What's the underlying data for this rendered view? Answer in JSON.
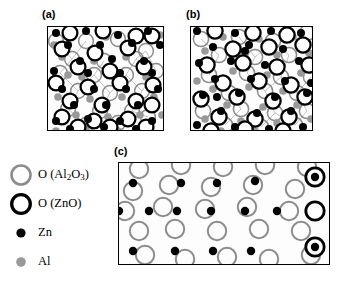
{
  "figure": {
    "panels": [
      {
        "id": "a",
        "label": "(a)",
        "x": 47,
        "y": 26,
        "w": 117,
        "h": 105
      },
      {
        "id": "b",
        "label": "(b)",
        "x": 190,
        "y": 26,
        "w": 123,
        "h": 105
      },
      {
        "id": "c",
        "label": "(c)",
        "x": 118,
        "y": 162,
        "w": 212,
        "h": 103
      }
    ],
    "labels": {
      "a": "(a)",
      "b": "(b)",
      "c": "(c)"
    }
  },
  "legend": {
    "items": [
      {
        "key": "o_al2o3",
        "glyph": "gray-ring-icon",
        "label_html": "O (Al<sub>2</sub>O<sub>3</sub>)",
        "label": "O (Al2O3)",
        "color": "#8c8c8c",
        "style": "ring"
      },
      {
        "key": "o_zno",
        "glyph": "black-ring-icon",
        "label_html": "O (ZnO)",
        "label": "O (ZnO)",
        "color": "#000000",
        "style": "ring"
      },
      {
        "key": "zn",
        "glyph": "black-dot-icon",
        "label_html": "Zn",
        "label": "Zn",
        "color": "#000000",
        "style": "dot"
      },
      {
        "key": "al",
        "glyph": "gray-dot-icon",
        "label_html": "Al",
        "label": "Al",
        "color": "#999999",
        "style": "dot"
      }
    ]
  },
  "colors": {
    "o_zno_ring": "#000000",
    "o_al2o3_ring": "#8c8c8c",
    "zn_dot": "#000000",
    "al_dot": "#999999",
    "panel_border": "#000000",
    "panel_bg": "#fdfdfd"
  },
  "chart_data": {
    "type": "scatter",
    "title": "",
    "xlabel": "",
    "ylabel": "",
    "species": [
      "O (Al2O3)",
      "O (ZnO)",
      "Zn",
      "Al"
    ],
    "panel_a": {
      "caption": "(a)",
      "o_zno_rings": [
        [
          22,
          6
        ],
        [
          55,
          4
        ],
        [
          88,
          9
        ],
        [
          14,
          22
        ],
        [
          47,
          26
        ],
        [
          80,
          21
        ],
        [
          104,
          9
        ],
        [
          30,
          40
        ],
        [
          62,
          44
        ],
        [
          96,
          40
        ],
        [
          8,
          56
        ],
        [
          40,
          60
        ],
        [
          72,
          56
        ],
        [
          105,
          58
        ],
        [
          22,
          74
        ],
        [
          54,
          78
        ],
        [
          88,
          74
        ],
        [
          14,
          90
        ],
        [
          46,
          94
        ],
        [
          80,
          92
        ],
        [
          104,
          78
        ],
        [
          30,
          100
        ],
        [
          62,
          100
        ],
        [
          98,
          100
        ]
      ],
      "o_al2o3_rings": [
        [
          38,
          14
        ],
        [
          70,
          12
        ],
        [
          98,
          24
        ],
        [
          24,
          32
        ],
        [
          56,
          34
        ],
        [
          88,
          32
        ],
        [
          12,
          46
        ],
        [
          46,
          48
        ],
        [
          78,
          48
        ],
        [
          30,
          64
        ],
        [
          62,
          66
        ],
        [
          94,
          64
        ],
        [
          20,
          82
        ],
        [
          52,
          84
        ],
        [
          84,
          84
        ],
        [
          38,
          98
        ],
        [
          70,
          96
        ],
        [
          100,
          90
        ],
        [
          8,
          14
        ],
        [
          108,
          44
        ]
      ],
      "zn_dots": [
        [
          8,
          6
        ],
        [
          38,
          4
        ],
        [
          70,
          8
        ],
        [
          100,
          4
        ],
        [
          20,
          18
        ],
        [
          52,
          18
        ],
        [
          84,
          16
        ],
        [
          112,
          18
        ],
        [
          32,
          34
        ],
        [
          64,
          32
        ],
        [
          96,
          34
        ],
        [
          6,
          44
        ],
        [
          40,
          46
        ],
        [
          72,
          46
        ],
        [
          104,
          46
        ],
        [
          14,
          62
        ],
        [
          46,
          62
        ],
        [
          78,
          62
        ],
        [
          110,
          62
        ],
        [
          26,
          78
        ],
        [
          58,
          78
        ],
        [
          90,
          78
        ],
        [
          8,
          94
        ],
        [
          40,
          92
        ],
        [
          72,
          94
        ],
        [
          104,
          94
        ],
        [
          56,
          100
        ],
        [
          22,
          102
        ],
        [
          88,
          102
        ]
      ],
      "al_dots": [
        [
          26,
          4
        ],
        [
          58,
          10
        ],
        [
          90,
          6
        ],
        [
          112,
          8
        ],
        [
          14,
          30
        ],
        [
          46,
          34
        ],
        [
          78,
          30
        ],
        [
          6,
          18
        ],
        [
          34,
          50
        ],
        [
          66,
          50
        ],
        [
          98,
          50
        ],
        [
          20,
          48
        ],
        [
          10,
          70
        ],
        [
          42,
          72
        ],
        [
          74,
          70
        ],
        [
          106,
          70
        ],
        [
          28,
          88
        ],
        [
          60,
          90
        ],
        [
          92,
          88
        ],
        [
          114,
          88
        ],
        [
          38,
          102
        ],
        [
          70,
          104
        ],
        [
          102,
          104
        ],
        [
          8,
          104
        ]
      ]
    },
    "panel_b": {
      "caption": "(b)",
      "o_zno_rings": [
        [
          24,
          4
        ],
        [
          62,
          6
        ],
        [
          96,
          8
        ],
        [
          42,
          22
        ],
        [
          78,
          20
        ],
        [
          112,
          18
        ],
        [
          16,
          38
        ],
        [
          52,
          36
        ],
        [
          86,
          40
        ],
        [
          118,
          38
        ],
        [
          32,
          56
        ],
        [
          68,
          54
        ],
        [
          100,
          58
        ],
        [
          10,
          72
        ],
        [
          46,
          70
        ],
        [
          82,
          74
        ],
        [
          114,
          70
        ],
        [
          28,
          90
        ],
        [
          64,
          92
        ],
        [
          98,
          90
        ],
        [
          54,
          102
        ],
        [
          20,
          104
        ],
        [
          92,
          104
        ]
      ],
      "o_al2o3_rings": [
        [
          10,
          12
        ],
        [
          48,
          10
        ],
        [
          82,
          14
        ],
        [
          116,
          6
        ],
        [
          28,
          28
        ],
        [
          64,
          30
        ],
        [
          98,
          28
        ],
        [
          18,
          48
        ],
        [
          56,
          46
        ],
        [
          90,
          50
        ],
        [
          120,
          50
        ],
        [
          38,
          66
        ],
        [
          74,
          64
        ],
        [
          106,
          66
        ],
        [
          12,
          84
        ],
        [
          50,
          82
        ],
        [
          84,
          86
        ],
        [
          116,
          84
        ],
        [
          34,
          98
        ],
        [
          70,
          100
        ],
        [
          104,
          98
        ]
      ],
      "zn_dots": [
        [
          6,
          4
        ],
        [
          44,
          6
        ],
        [
          80,
          4
        ],
        [
          110,
          6
        ],
        [
          22,
          20
        ],
        [
          58,
          18
        ],
        [
          92,
          22
        ],
        [
          8,
          36
        ],
        [
          40,
          34
        ],
        [
          74,
          38
        ],
        [
          108,
          34
        ],
        [
          24,
          52
        ],
        [
          60,
          52
        ],
        [
          94,
          54
        ],
        [
          120,
          56
        ],
        [
          12,
          68
        ],
        [
          48,
          66
        ],
        [
          84,
          70
        ],
        [
          116,
          66
        ],
        [
          30,
          84
        ],
        [
          66,
          86
        ],
        [
          100,
          84
        ],
        [
          6,
          98
        ],
        [
          44,
          100
        ],
        [
          78,
          102
        ],
        [
          112,
          100
        ],
        [
          54,
          24
        ],
        [
          26,
          70
        ]
      ],
      "al_dots": [
        [
          32,
          10
        ],
        [
          68,
          12
        ],
        [
          102,
          10
        ],
        [
          14,
          24
        ],
        [
          50,
          26
        ],
        [
          86,
          28
        ],
        [
          118,
          26
        ],
        [
          6,
          54
        ],
        [
          42,
          44
        ],
        [
          76,
          48
        ],
        [
          110,
          46
        ],
        [
          22,
          62
        ],
        [
          58,
          60
        ],
        [
          92,
          64
        ],
        [
          36,
          78
        ],
        [
          72,
          80
        ],
        [
          106,
          78
        ],
        [
          14,
          92
        ],
        [
          50,
          94
        ],
        [
          86,
          96
        ],
        [
          120,
          92
        ],
        [
          30,
          104
        ],
        [
          64,
          104
        ],
        [
          98,
          106
        ]
      ]
    },
    "panel_c": {
      "caption": "(c)",
      "o_al2o3_rings": [
        [
          20,
          6
        ],
        [
          62,
          2
        ],
        [
          104,
          4
        ],
        [
          146,
          2
        ],
        [
          188,
          4
        ],
        [
          14,
          28
        ],
        [
          50,
          22
        ],
        [
          92,
          24
        ],
        [
          134,
          22
        ],
        [
          176,
          26
        ],
        [
          6,
          48
        ],
        [
          44,
          44
        ],
        [
          86,
          46
        ],
        [
          128,
          44
        ],
        [
          170,
          48
        ],
        [
          20,
          68
        ],
        [
          56,
          66
        ],
        [
          98,
          68
        ],
        [
          140,
          66
        ],
        [
          182,
          68
        ],
        [
          26,
          92
        ],
        [
          66,
          96
        ],
        [
          108,
          94
        ],
        [
          150,
          96
        ],
        [
          192,
          92
        ]
      ],
      "o_zno_rings": [
        [
          196,
          14
        ],
        [
          196,
          48
        ],
        [
          196,
          84
        ]
      ],
      "zn_dots": [
        [
          14,
          20
        ],
        [
          62,
          20
        ],
        [
          98,
          20
        ],
        [
          136,
          18
        ],
        [
          0,
          48
        ],
        [
          30,
          48
        ],
        [
          58,
          48
        ],
        [
          92,
          48
        ],
        [
          126,
          48
        ],
        [
          158,
          48
        ],
        [
          14,
          88
        ],
        [
          56,
          88
        ],
        [
          94,
          88
        ],
        [
          132,
          88
        ],
        [
          196,
          14
        ],
        [
          196,
          84
        ]
      ],
      "al_dots": []
    }
  }
}
